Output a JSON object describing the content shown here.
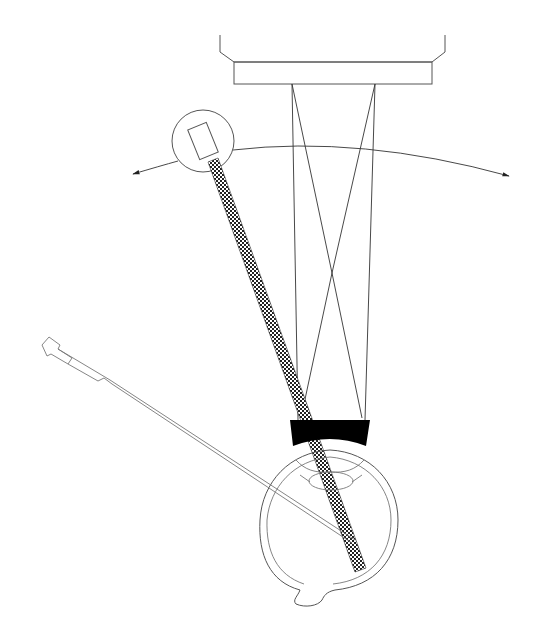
{
  "diagram": {
    "title": "",
    "colors": {
      "background": "#ffffff",
      "line": "#555555",
      "beam_fill": "#222222",
      "lens": "#000000"
    },
    "components": [
      {
        "id": "microscope-objective",
        "label": ""
      },
      {
        "id": "light-source",
        "label": ""
      },
      {
        "id": "rotation-arc",
        "label": ""
      },
      {
        "id": "light-beam",
        "label": ""
      },
      {
        "id": "contact-lens",
        "label": ""
      },
      {
        "id": "eye",
        "label": ""
      },
      {
        "id": "probe",
        "label": ""
      },
      {
        "id": "optical-rays",
        "label": ""
      }
    ]
  }
}
